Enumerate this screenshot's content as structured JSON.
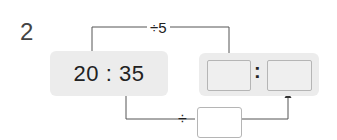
{
  "problem": {
    "number": "2",
    "ratio": "20 : 35",
    "top_operation": "÷5",
    "bottom_operator": "÷",
    "result_separator": ":",
    "blanks": {
      "result_first": "",
      "result_second": "",
      "divisor": ""
    }
  },
  "colors": {
    "box_fill": "#ececec",
    "blank_border": "#b5b5b5",
    "line": "#555555"
  }
}
